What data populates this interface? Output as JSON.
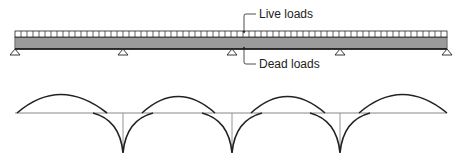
{
  "labels": {
    "live": "Live loads",
    "dead": "Dead loads"
  },
  "beam": {
    "x_start": 15,
    "x_end": 447,
    "supports_x": [
      15,
      123,
      232,
      340,
      447
    ],
    "spans": 4
  },
  "colors": {
    "line": "#222222",
    "dead_fill": "#c8c8c8",
    "diagram_line": "#222222",
    "baseline": "#888888"
  }
}
